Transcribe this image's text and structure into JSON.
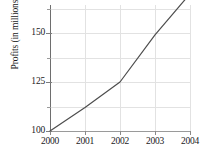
{
  "chart_data": {
    "type": "line",
    "title": "",
    "xlabel": "",
    "ylabel": "Profits (in millions)",
    "categories": [
      "2000",
      "2001",
      "2002",
      "2003",
      "2004"
    ],
    "x": [
      2000,
      2001,
      2002,
      2003,
      2004
    ],
    "values": [
      100,
      112,
      125,
      149,
      170
    ],
    "series": [
      {
        "name": "Profits",
        "values": [
          100,
          112,
          125,
          149,
          170
        ],
        "color": "#4d4d4d"
      }
    ],
    "xlim": [
      2000,
      2004
    ],
    "ylim": [
      100,
      175
    ],
    "y_major_ticks": [
      100,
      125,
      150
    ],
    "y_major_tick_labels": [
      "100",
      "125",
      "150"
    ],
    "y_minor_ticks": [
      112.5,
      137.5,
      162.5,
      175
    ],
    "x_ticks": [
      2000,
      2001,
      2002,
      2003,
      2004
    ],
    "x_tick_labels": [
      "2000",
      "2001",
      "2002",
      "2003",
      "2004"
    ],
    "grid": true,
    "grid_color": "#e2e2e2",
    "legend": null,
    "legend_position": "none",
    "axis_color": "#7d7d7d",
    "text_color": "#1a1a1a",
    "background": "#ffffff"
  }
}
